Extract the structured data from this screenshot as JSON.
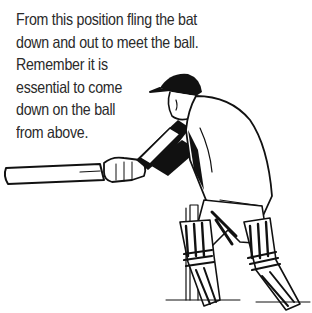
{
  "caption": {
    "lines": [
      "From this position fling the bat",
      "down and out to meet the ball.",
      "Remember it is",
      "essential to come",
      "down on the ball",
      "from above."
    ]
  },
  "figure": {
    "ink_color": "#111111",
    "paper_color": "#ffffff"
  }
}
